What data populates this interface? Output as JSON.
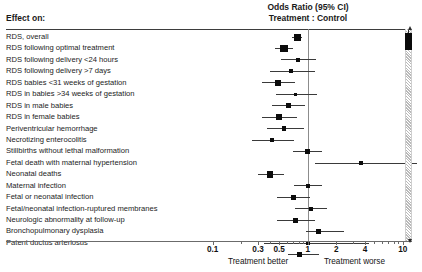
{
  "header": {
    "effect_on_label": "Effect on:",
    "title": "Odds Ratio (95% CI)\nTreatment : Control"
  },
  "axis": {
    "xlabel_left": "Treatment better",
    "xlabel_right": "Treatment worse",
    "tick_labels": [
      "0.1",
      "0.3",
      "0.5",
      "1",
      "2",
      "4",
      "10"
    ],
    "tick_values": [
      0.1,
      0.3,
      0.5,
      1,
      2,
      4,
      10
    ],
    "minor_ticks": [
      0.2,
      0.4,
      0.6,
      0.7,
      0.8,
      0.9,
      3,
      5,
      6,
      7,
      8,
      9
    ],
    "reference_value": 1,
    "scale": "log",
    "xlim": [
      0.085,
      12.5
    ]
  },
  "chart_data": {
    "type": "forest",
    "title": "Odds Ratio (95% CI) Treatment : Control",
    "xlabel": "Odds Ratio (95% CI)",
    "ylabel": "Effect on:",
    "xscale": "log",
    "xlim": [
      0.085,
      12.5
    ],
    "reference_line": 1,
    "grid": false,
    "legend": "none",
    "annotations": [
      "Treatment better",
      "Treatment worse"
    ],
    "measure": "Odds Ratio (95% CI), Treatment : Control",
    "rows": [
      {
        "label": "RDS, overall",
        "or": 0.78,
        "low": 0.69,
        "high": 0.88,
        "marker": 7.0
      },
      {
        "label": "RDS following optimal treatment",
        "or": 0.56,
        "low": 0.45,
        "high": 0.7,
        "marker": 7.5
      },
      {
        "label": "RDS following delivery <24 hours",
        "or": 0.79,
        "low": 0.52,
        "high": 1.22,
        "marker": 4.0
      },
      {
        "label": "RDS following delivery >7 days",
        "or": 0.67,
        "low": 0.4,
        "high": 1.19,
        "marker": 4.0
      },
      {
        "label": "RDS babies <31 weeks of gestation",
        "or": 0.49,
        "low": 0.33,
        "high": 0.74,
        "marker": 6.0
      },
      {
        "label": "RDS in babies >34 weeks of gestation",
        "or": 0.74,
        "low": 0.46,
        "high": 1.24,
        "marker": 3.5
      },
      {
        "label": "RDS in male babies",
        "or": 0.62,
        "low": 0.42,
        "high": 0.94,
        "marker": 5.0
      },
      {
        "label": "RDS in female babies",
        "or": 0.5,
        "low": 0.33,
        "high": 0.78,
        "marker": 6.0
      },
      {
        "label": "Periventricular hemorrhage",
        "or": 0.56,
        "low": 0.37,
        "high": 0.92,
        "marker": 4.5
      },
      {
        "label": "Necrotizing enterocolitis",
        "or": 0.42,
        "low": 0.26,
        "high": 0.72,
        "marker": 4.0
      },
      {
        "label": "Stillbirths without lethal malformation",
        "or": 0.99,
        "low": 0.7,
        "high": 1.4,
        "marker": 4.5
      },
      {
        "label": "Fetal death with maternal hypertension",
        "or": 3.6,
        "low": 1.2,
        "high": 14.0,
        "marker": 4.0
      },
      {
        "label": "Neonatal deaths",
        "or": 0.4,
        "low": 0.3,
        "high": 0.56,
        "marker": 6.5
      },
      {
        "label": "Maternal infection",
        "or": 1.0,
        "low": 0.72,
        "high": 1.4,
        "marker": 4.0
      },
      {
        "label": "Fetal or neonatal infection",
        "or": 0.71,
        "low": 0.47,
        "high": 1.06,
        "marker": 4.5
      },
      {
        "label": "Fetal/neonatal infection-ruptured membranes",
        "or": 1.08,
        "low": 0.74,
        "high": 1.58,
        "marker": 4.0
      },
      {
        "label": "Neurologic abnormality at follow-up",
        "or": 0.75,
        "low": 0.47,
        "high": 1.19,
        "marker": 5.0
      },
      {
        "label": "Bronchopulmonary dysplasia",
        "or": 1.3,
        "low": 0.95,
        "high": 2.4,
        "marker": 5.0
      },
      {
        "label": "Patent ductus arteriosus",
        "or": 1.0,
        "low": 0.35,
        "high": 4.4,
        "marker": 4.5
      },
      {
        "label": "",
        "or": 0.82,
        "low": 0.62,
        "high": 1.3,
        "marker": 5.0
      }
    ]
  },
  "right_indicator": {
    "name": "scale-indicator-bar",
    "hatched": true,
    "block_from_top_pct": 1,
    "block_height_pct": 8,
    "hatch_color": "#b9b9b9",
    "block_color": "#0a0a0a"
  },
  "colors": {
    "marker": "#0c0c0c",
    "ci_line": "#3a3a3a",
    "reference_line": "#8c8c8c",
    "rule": "#3d3d3d",
    "axis": "#6b6b6b",
    "text": "#1a1a1a",
    "background": "#ffffff"
  }
}
